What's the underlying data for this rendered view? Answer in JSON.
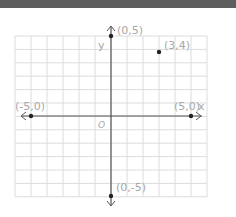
{
  "chart_data": {
    "type": "scatter",
    "title": "",
    "xlabel": "x",
    "ylabel": "y",
    "origin_label": "O",
    "xlim": [
      -6,
      6
    ],
    "ylim": [
      -6,
      6
    ],
    "grid": true,
    "points": [
      {
        "x": 0,
        "y": 5,
        "label": "(0,5)"
      },
      {
        "x": 3,
        "y": 4,
        "label": "(3,4)"
      },
      {
        "x": -5,
        "y": 0,
        "label": "(-5,0)"
      },
      {
        "x": 5,
        "y": 0,
        "label": "(5,0)"
      },
      {
        "x": 0,
        "y": -5,
        "label": "(0,-5)"
      }
    ]
  },
  "colors": {
    "grid": "#dcdcdc",
    "axis": "#555555",
    "point": "#222222",
    "label": "#a8a8a8",
    "topbar": "#5e5e5e"
  }
}
